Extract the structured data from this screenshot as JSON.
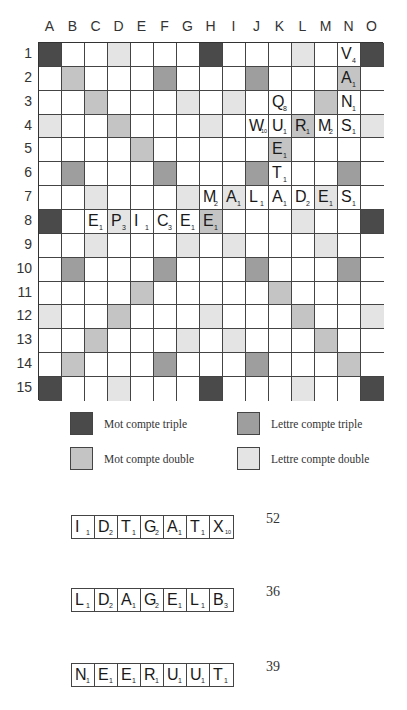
{
  "board": {
    "columns": [
      "A",
      "B",
      "C",
      "D",
      "E",
      "F",
      "G",
      "H",
      "I",
      "J",
      "K",
      "L",
      "M",
      "N",
      "O"
    ],
    "rows": [
      "1",
      "2",
      "3",
      "4",
      "5",
      "6",
      "7",
      "8",
      "9",
      "10",
      "11",
      "12",
      "13",
      "14",
      "15"
    ],
    "premium_map": [
      "T..d...T...d..T",
      ".D...t...t...D.",
      "..D...d.d...D..",
      "d..D...d...D..d",
      "....D.....D....",
      ".t...t...t...t.",
      "..d...d.d...d..",
      "T..d...D...d..T",
      "..d...d.d...d..",
      ".t...t...t...t.",
      "....D.....D....",
      "d..D...d...D..d",
      "..D...d.d...D..",
      ".D...t...t...D.",
      "T..d...T...d..T"
    ],
    "premium_legend": {
      "T": "tw",
      "D": "dw",
      "t": "tl",
      "d": "dl",
      ".": ""
    },
    "tiles": [
      {
        "col": "N",
        "row": 1,
        "letter": "V",
        "value": "4"
      },
      {
        "col": "N",
        "row": 2,
        "letter": "A",
        "value": "1"
      },
      {
        "col": "K",
        "row": 3,
        "letter": "Q",
        "value": "8"
      },
      {
        "col": "N",
        "row": 3,
        "letter": "N",
        "value": "1"
      },
      {
        "col": "J",
        "row": 4,
        "letter": "W",
        "value": "10"
      },
      {
        "col": "K",
        "row": 4,
        "letter": "U",
        "value": "1"
      },
      {
        "col": "L",
        "row": 4,
        "letter": "R",
        "value": "1"
      },
      {
        "col": "M",
        "row": 4,
        "letter": "M",
        "value": "2"
      },
      {
        "col": "N",
        "row": 4,
        "letter": "S",
        "value": "1"
      },
      {
        "col": "K",
        "row": 5,
        "letter": "E",
        "value": "1"
      },
      {
        "col": "K",
        "row": 6,
        "letter": "T",
        "value": "1"
      },
      {
        "col": "H",
        "row": 7,
        "letter": "M",
        "value": "2"
      },
      {
        "col": "I",
        "row": 7,
        "letter": "A",
        "value": "1"
      },
      {
        "col": "J",
        "row": 7,
        "letter": "L",
        "value": "1"
      },
      {
        "col": "K",
        "row": 7,
        "letter": "A",
        "value": "1"
      },
      {
        "col": "L",
        "row": 7,
        "letter": "D",
        "value": "2"
      },
      {
        "col": "M",
        "row": 7,
        "letter": "E",
        "value": "1"
      },
      {
        "col": "N",
        "row": 7,
        "letter": "S",
        "value": "1"
      },
      {
        "col": "C",
        "row": 8,
        "letter": "E",
        "value": "1"
      },
      {
        "col": "D",
        "row": 8,
        "letter": "P",
        "value": "3"
      },
      {
        "col": "E",
        "row": 8,
        "letter": "I",
        "value": "1"
      },
      {
        "col": "F",
        "row": 8,
        "letter": "C",
        "value": "3"
      },
      {
        "col": "G",
        "row": 8,
        "letter": "E",
        "value": "1"
      },
      {
        "col": "H",
        "row": 8,
        "letter": "E",
        "value": "1"
      }
    ]
  },
  "colors": {
    "triple_word": "#4a4a4a",
    "double_word": "#c4c4c4",
    "triple_letter": "#9e9e9e",
    "double_letter": "#e4e4e4"
  },
  "legend": {
    "triple_word": "Mot compte triple",
    "double_word": "Mot compte double",
    "triple_letter": "Lettre compte triple",
    "double_letter": "Lettre compte double"
  },
  "racks": [
    {
      "tiles": [
        {
          "letter": "I",
          "value": "1"
        },
        {
          "letter": "D",
          "value": "2"
        },
        {
          "letter": "T",
          "value": "1"
        },
        {
          "letter": "G",
          "value": "2"
        },
        {
          "letter": "A",
          "value": "1"
        },
        {
          "letter": "T",
          "value": "1"
        },
        {
          "letter": "X",
          "value": "10"
        }
      ],
      "score": "52"
    },
    {
      "tiles": [
        {
          "letter": "L",
          "value": "1"
        },
        {
          "letter": "D",
          "value": "2"
        },
        {
          "letter": "A",
          "value": "1"
        },
        {
          "letter": "G",
          "value": "2"
        },
        {
          "letter": "E",
          "value": "1"
        },
        {
          "letter": "L",
          "value": "1"
        },
        {
          "letter": "B",
          "value": "3"
        }
      ],
      "score": "36"
    },
    {
      "tiles": [
        {
          "letter": "N",
          "value": "1"
        },
        {
          "letter": "E",
          "value": "1"
        },
        {
          "letter": "E",
          "value": "1"
        },
        {
          "letter": "R",
          "value": "1"
        },
        {
          "letter": "U",
          "value": "1"
        },
        {
          "letter": "U",
          "value": "1"
        },
        {
          "letter": "T",
          "value": "1"
        }
      ],
      "score": "39"
    }
  ]
}
